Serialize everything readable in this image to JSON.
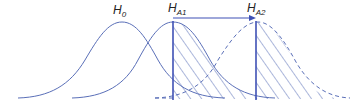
{
  "labels": {
    "h0": {
      "main": "H",
      "sub": "0"
    },
    "ha1": {
      "main": "H",
      "sub": "A1"
    },
    "ha2": {
      "main": "H",
      "sub": "A2"
    }
  },
  "colors": {
    "curve": "#5a6fb8",
    "line": "#3f51b5",
    "hatch": "#5a6fb8"
  }
}
